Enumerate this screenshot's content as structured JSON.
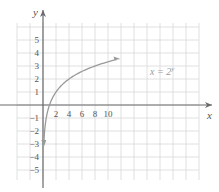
{
  "chart_data": {
    "type": "line",
    "title": "",
    "xlabel": "x",
    "ylabel": "y",
    "xlim": [
      -2,
      12
    ],
    "ylim": [
      -6,
      6
    ],
    "grid": true,
    "x_ticks": [
      2,
      4,
      6,
      8,
      10
    ],
    "y_ticks": [
      -5,
      -4,
      -3,
      -2,
      -1,
      1,
      2,
      3,
      4,
      5
    ],
    "series": [
      {
        "name": "x = 2^y",
        "label_text": "x = 2",
        "label_sup": "y",
        "x": [
          0.125,
          0.25,
          0.5,
          1,
          2,
          4,
          8,
          11.3
        ],
        "y": [
          -3,
          -2,
          -1,
          0,
          1,
          2,
          3,
          3.5
        ]
      }
    ]
  },
  "colors": {
    "grid": "#d8d8d8",
    "axis": "#6a6a6a",
    "curve": "#9a9a9a"
  }
}
